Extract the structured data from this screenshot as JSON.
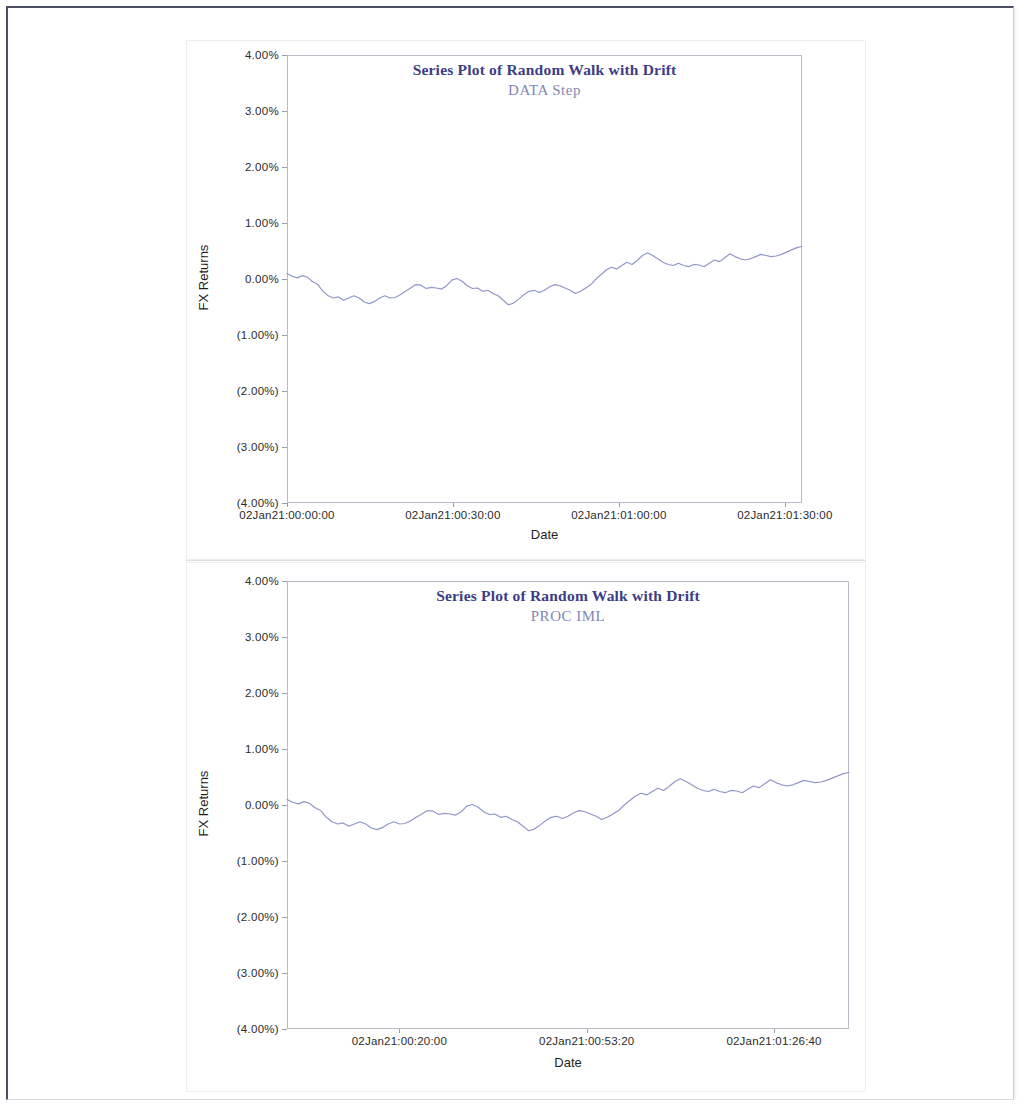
{
  "document": {
    "background_color": "#ffffff",
    "frame_color": "#4a4f63"
  },
  "charts": [
    {
      "id": "data-step",
      "title": "Series Plot of Random Walk with Drift",
      "subtitle": "DATA Step",
      "xlabel": "Date",
      "ylabel": "FX Returns",
      "yticks": [
        "4.00%",
        "3.00%",
        "2.00%",
        "1.00%",
        "0.00%",
        "(1.00%)",
        "(2.00%)",
        "(3.00%)",
        "(4.00%)"
      ],
      "xticks": [
        "02Jan21:00:00:00",
        "02Jan21:00:30:00",
        "02Jan21:01:00:00",
        "02Jan21:01:30:00"
      ],
      "xtick_positions": [
        0.0,
        0.3222,
        0.6444,
        0.9667
      ],
      "title_color": "#3c3d86",
      "subtitle_color": "#8386b6",
      "line_color": "#8f96c9"
    },
    {
      "id": "proc-iml",
      "title": "Series Plot of Random Walk with Drift",
      "subtitle": "PROC IML",
      "xlabel": "Date",
      "ylabel": "FX Returns",
      "yticks": [
        "4.00%",
        "3.00%",
        "2.00%",
        "1.00%",
        "0.00%",
        "(1.00%)",
        "(2.00%)",
        "(3.00%)",
        "(4.00%)"
      ],
      "xticks": [
        "02Jan21:00:20:00",
        "02Jan21:00:53:20",
        "02Jan21:01:26:40"
      ],
      "xtick_positions": [
        0.2,
        0.5333,
        0.8667
      ],
      "title_color": "#3c3d86",
      "subtitle_color": "#8386b6",
      "line_color": "#8f96c9"
    }
  ],
  "chart_data": [
    {
      "type": "line",
      "title": "Series Plot of Random Walk with Drift",
      "subtitle": "DATA Step",
      "xlabel": "Date",
      "ylabel": "FX Returns",
      "ylim": [
        -4.0,
        4.0
      ],
      "ytick_values": [
        4.0,
        3.0,
        2.0,
        1.0,
        0.0,
        -1.0,
        -2.0,
        -3.0,
        -4.0
      ],
      "ytick_labels": [
        "4.00%",
        "3.00%",
        "2.00%",
        "1.00%",
        "0.00%",
        "(1.00%)",
        "(2.00%)",
        "(3.00%)",
        "(4.00%)"
      ],
      "xtick_labels": [
        "02Jan21:00:00:00",
        "02Jan21:00:30:00",
        "02Jan21:01:00:00",
        "02Jan21:01:30:00"
      ],
      "grid": false,
      "legend": "none",
      "series": [
        {
          "name": "FX Returns",
          "color": "#8f96c9",
          "x": [
            0,
            1,
            2,
            3,
            4,
            5,
            6,
            7,
            8,
            9,
            10,
            11,
            12,
            13,
            14,
            15,
            16,
            17,
            18,
            19,
            20,
            21,
            22,
            23,
            24,
            25,
            26,
            27,
            28,
            29,
            30,
            31,
            32,
            33,
            34,
            35,
            36,
            37,
            38,
            39,
            40,
            41,
            42,
            43,
            44,
            45,
            46,
            47,
            48,
            49,
            50,
            51,
            52,
            53,
            54,
            55,
            56,
            57,
            58,
            59,
            60,
            61,
            62,
            63,
            64,
            65,
            66,
            67,
            68,
            69,
            70,
            71,
            72,
            73,
            74,
            75,
            76,
            77,
            78,
            79,
            80,
            81,
            82,
            83,
            84,
            85,
            86,
            87,
            88,
            89,
            90,
            91,
            92,
            93,
            94,
            95,
            96,
            97,
            98,
            99,
            100
          ],
          "values": [
            0.1,
            0.05,
            0.02,
            0.06,
            0.03,
            -0.05,
            -0.1,
            -0.22,
            -0.3,
            -0.34,
            -0.32,
            -0.38,
            -0.34,
            -0.3,
            -0.34,
            -0.41,
            -0.44,
            -0.4,
            -0.34,
            -0.3,
            -0.34,
            -0.33,
            -0.28,
            -0.22,
            -0.16,
            -0.1,
            -0.11,
            -0.17,
            -0.15,
            -0.16,
            -0.18,
            -0.12,
            -0.02,
            0.01,
            -0.04,
            -0.12,
            -0.17,
            -0.16,
            -0.22,
            -0.2,
            -0.26,
            -0.3,
            -0.38,
            -0.46,
            -0.43,
            -0.36,
            -0.28,
            -0.22,
            -0.2,
            -0.24,
            -0.2,
            -0.14,
            -0.1,
            -0.12,
            -0.16,
            -0.2,
            -0.26,
            -0.22,
            -0.16,
            -0.1,
            0.0,
            0.08,
            0.16,
            0.21,
            0.18,
            0.24,
            0.3,
            0.26,
            0.33,
            0.42,
            0.47,
            0.42,
            0.36,
            0.3,
            0.26,
            0.24,
            0.28,
            0.24,
            0.22,
            0.26,
            0.25,
            0.22,
            0.28,
            0.34,
            0.31,
            0.38,
            0.45,
            0.4,
            0.36,
            0.34,
            0.36,
            0.4,
            0.44,
            0.42,
            0.4,
            0.41,
            0.44,
            0.48,
            0.52,
            0.56,
            0.58
          ]
        }
      ]
    },
    {
      "type": "line",
      "title": "Series Plot of Random Walk with Drift",
      "subtitle": "PROC IML",
      "xlabel": "Date",
      "ylabel": "FX Returns",
      "ylim": [
        -4.0,
        4.0
      ],
      "ytick_values": [
        4.0,
        3.0,
        2.0,
        1.0,
        0.0,
        -1.0,
        -2.0,
        -3.0,
        -4.0
      ],
      "ytick_labels": [
        "4.00%",
        "3.00%",
        "2.00%",
        "1.00%",
        "0.00%",
        "(1.00%)",
        "(2.00%)",
        "(3.00%)",
        "(4.00%)"
      ],
      "xtick_labels": [
        "02Jan21:00:20:00",
        "02Jan21:00:53:20",
        "02Jan21:01:26:40"
      ],
      "grid": false,
      "legend": "none",
      "series": [
        {
          "name": "FX Returns",
          "color": "#8f96c9",
          "x": [
            0,
            1,
            2,
            3,
            4,
            5,
            6,
            7,
            8,
            9,
            10,
            11,
            12,
            13,
            14,
            15,
            16,
            17,
            18,
            19,
            20,
            21,
            22,
            23,
            24,
            25,
            26,
            27,
            28,
            29,
            30,
            31,
            32,
            33,
            34,
            35,
            36,
            37,
            38,
            39,
            40,
            41,
            42,
            43,
            44,
            45,
            46,
            47,
            48,
            49,
            50,
            51,
            52,
            53,
            54,
            55,
            56,
            57,
            58,
            59,
            60,
            61,
            62,
            63,
            64,
            65,
            66,
            67,
            68,
            69,
            70,
            71,
            72,
            73,
            74,
            75,
            76,
            77,
            78,
            79,
            80,
            81,
            82,
            83,
            84,
            85,
            86,
            87,
            88,
            89,
            90,
            91,
            92,
            93,
            94,
            95,
            96,
            97,
            98,
            99,
            100
          ],
          "values": [
            0.1,
            0.05,
            0.02,
            0.06,
            0.03,
            -0.05,
            -0.1,
            -0.22,
            -0.3,
            -0.34,
            -0.32,
            -0.38,
            -0.34,
            -0.3,
            -0.34,
            -0.41,
            -0.44,
            -0.4,
            -0.34,
            -0.3,
            -0.34,
            -0.33,
            -0.28,
            -0.22,
            -0.16,
            -0.1,
            -0.11,
            -0.17,
            -0.15,
            -0.16,
            -0.18,
            -0.12,
            -0.02,
            0.01,
            -0.04,
            -0.12,
            -0.17,
            -0.16,
            -0.22,
            -0.2,
            -0.26,
            -0.3,
            -0.38,
            -0.46,
            -0.43,
            -0.36,
            -0.28,
            -0.22,
            -0.2,
            -0.24,
            -0.2,
            -0.14,
            -0.1,
            -0.12,
            -0.16,
            -0.2,
            -0.26,
            -0.22,
            -0.16,
            -0.1,
            0.0,
            0.08,
            0.16,
            0.21,
            0.18,
            0.24,
            0.3,
            0.26,
            0.33,
            0.42,
            0.47,
            0.42,
            0.36,
            0.3,
            0.26,
            0.24,
            0.28,
            0.24,
            0.22,
            0.26,
            0.25,
            0.22,
            0.28,
            0.34,
            0.31,
            0.38,
            0.45,
            0.4,
            0.36,
            0.34,
            0.36,
            0.4,
            0.44,
            0.42,
            0.4,
            0.41,
            0.44,
            0.48,
            0.52,
            0.56,
            0.58
          ]
        }
      ]
    }
  ]
}
